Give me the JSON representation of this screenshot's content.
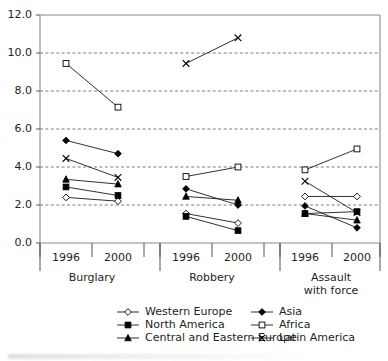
{
  "chart_data": {
    "type": "line",
    "title": "",
    "subtitle": "",
    "xlabel": "",
    "ylabel": "",
    "ylim": [
      0.0,
      12.0
    ],
    "yticks": [
      "0.0",
      "2.0",
      "4.0",
      "6.0",
      "8.0",
      "10.0",
      "12.0"
    ],
    "ytick_values": [
      0.0,
      2.0,
      4.0,
      6.0,
      8.0,
      10.0,
      12.0
    ],
    "grid": "horizontal-dashed",
    "legend_position": "bottom",
    "groups": [
      {
        "label": "Burglary",
        "years": [
          "1996",
          "2000"
        ]
      },
      {
        "label": "Robbery",
        "years": [
          "1996",
          "2000"
        ]
      },
      {
        "label": "Assault with force",
        "label_line1": "Assault",
        "label_line2": "with force",
        "years": [
          "1996",
          "2000"
        ]
      }
    ],
    "categories": [
      "Burglary 1996",
      "Burglary 2000",
      "Robbery 1996",
      "Robbery 2000",
      "Assault 1996",
      "Assault 2000"
    ],
    "series": [
      {
        "name": "Western Europe",
        "marker": "open-diamond",
        "values_by_group": {
          "Burglary": [
            2.4,
            2.2
          ],
          "Robbery": [
            1.55,
            1.05
          ],
          "Assault": [
            2.45,
            2.45
          ]
        }
      },
      {
        "name": "North America",
        "marker": "filled-square",
        "values_by_group": {
          "Burglary": [
            2.95,
            2.5
          ],
          "Robbery": [
            1.4,
            0.65
          ],
          "Assault": [
            1.55,
            1.65
          ]
        }
      },
      {
        "name": "Central and Eastern Europe",
        "marker": "filled-triangle",
        "values_by_group": {
          "Burglary": [
            3.35,
            3.1
          ],
          "Robbery": [
            2.45,
            2.25
          ],
          "Assault": [
            1.55,
            1.2
          ]
        }
      },
      {
        "name": "Asia",
        "marker": "filled-diamond",
        "values_by_group": {
          "Burglary": [
            5.4,
            4.7
          ],
          "Robbery": [
            2.85,
            2.0
          ],
          "Assault": [
            1.95,
            0.8
          ]
        }
      },
      {
        "name": "Africa",
        "marker": "open-square",
        "values_by_group": {
          "Burglary": [
            9.45,
            7.15
          ],
          "Robbery": [
            3.5,
            4.0
          ],
          "Assault": [
            3.85,
            4.95
          ]
        }
      },
      {
        "name": "Latin America",
        "marker": "x-cross",
        "values_by_group": {
          "Burglary": [
            4.45,
            3.45
          ],
          "Robbery": [
            9.45,
            10.8
          ],
          "Assault": [
            3.25,
            1.6
          ]
        }
      }
    ],
    "legend": [
      {
        "label": "Western Europe",
        "marker": "open-diamond",
        "column": 1
      },
      {
        "label": "North America",
        "marker": "filled-square",
        "column": 1
      },
      {
        "label": "Central and Eastern Europe",
        "marker": "filled-triangle",
        "column": 1
      },
      {
        "label": "Asia",
        "marker": "filled-diamond",
        "column": 2
      },
      {
        "label": "Africa",
        "marker": "open-square",
        "column": 2
      },
      {
        "label": "Latin America",
        "marker": "x-cross",
        "column": 2
      }
    ],
    "colors": {
      "line": "#1a1a1a",
      "marker_fill": "#000000",
      "marker_open_fill": "#ffffff",
      "grid": "#5a5a5a",
      "axis": "#8a8a8a",
      "text": "#231f20",
      "background": "#ffffff"
    }
  }
}
